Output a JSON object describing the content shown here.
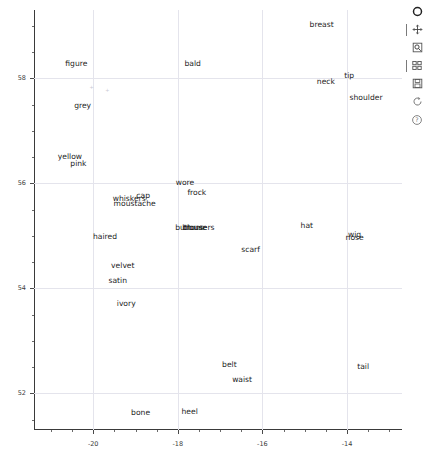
{
  "chart_data": {
    "type": "scatter",
    "title": "",
    "xlabel": "",
    "ylabel": "",
    "xlim": [
      -21.4,
      -12.7
    ],
    "ylim": [
      51.3,
      59.3
    ],
    "grid": true,
    "legend": null,
    "xticks": [
      -20,
      -18,
      -16,
      -14
    ],
    "xticklabels": [
      "-20",
      "-18",
      "-16",
      "-14"
    ],
    "yticks": [
      52,
      54,
      56,
      58
    ],
    "yticklabels": [
      "52",
      "54",
      "56",
      "58"
    ],
    "point_labels": [
      {
        "label": "breast",
        "x": -14.6,
        "y": 59.02
      },
      {
        "label": "figure",
        "x": -20.4,
        "y": 58.27
      },
      {
        "label": "bald",
        "x": -17.65,
        "y": 58.27
      },
      {
        "label": "tip",
        "x": -13.95,
        "y": 58.04
      },
      {
        "label": "neck",
        "x": -14.5,
        "y": 57.92
      },
      {
        "label": "shoulder",
        "x": -13.55,
        "y": 57.63
      },
      {
        "label": "grey",
        "x": -20.25,
        "y": 57.48
      },
      {
        "label": "yellow",
        "x": -20.55,
        "y": 56.5
      },
      {
        "label": "pink",
        "x": -20.35,
        "y": 56.37
      },
      {
        "label": "wore",
        "x": -17.83,
        "y": 56.0
      },
      {
        "label": "frock",
        "x": -17.55,
        "y": 55.82
      },
      {
        "label": "whiskers",
        "x": -19.15,
        "y": 55.7
      },
      {
        "label": "cap",
        "x": -18.82,
        "y": 55.75
      },
      {
        "label": "moustache",
        "x": -19.02,
        "y": 55.6
      },
      {
        "label": "hat",
        "x": -14.95,
        "y": 55.18
      },
      {
        "label": "buttons",
        "x": -17.72,
        "y": 55.15
      },
      {
        "label": "blouse",
        "x": -17.6,
        "y": 55.15
      },
      {
        "label": "trousers",
        "x": -17.5,
        "y": 55.15
      },
      {
        "label": "wig",
        "x": -13.82,
        "y": 55.02
      },
      {
        "label": "nose",
        "x": -13.82,
        "y": 54.95
      },
      {
        "label": "haired",
        "x": -19.72,
        "y": 54.98
      },
      {
        "label": "scarf",
        "x": -16.28,
        "y": 54.72
      },
      {
        "label": "velvet",
        "x": -19.3,
        "y": 54.42
      },
      {
        "label": "satin",
        "x": -19.42,
        "y": 54.13
      },
      {
        "label": "ivory",
        "x": -19.22,
        "y": 53.7
      },
      {
        "label": "belt",
        "x": -16.78,
        "y": 52.53
      },
      {
        "label": "tail",
        "x": -13.62,
        "y": 52.5
      },
      {
        "label": "waist",
        "x": -16.48,
        "y": 52.25
      },
      {
        "label": "bone",
        "x": -18.88,
        "y": 51.63
      },
      {
        "label": "heel",
        "x": -17.72,
        "y": 51.65
      }
    ],
    "faint_markers": [
      {
        "x": -20.05,
        "y": 57.83
      },
      {
        "x": -19.68,
        "y": 57.77
      }
    ]
  },
  "toolbar": {
    "buttons": [
      {
        "name": "home-icon",
        "tooltip": "Reset original view"
      },
      {
        "name": "move-icon",
        "tooltip": "Pan axes with left mouse"
      },
      {
        "name": "zoom-rect-icon",
        "tooltip": "Zoom to rectangle"
      },
      {
        "name": "configure-subplots-icon",
        "tooltip": "Configure subplots"
      },
      {
        "name": "save-icon",
        "tooltip": "Save the figure"
      },
      {
        "name": "refresh-icon",
        "tooltip": "Redraw"
      },
      {
        "name": "help-icon",
        "tooltip": "Help"
      }
    ]
  },
  "colors": {
    "background": "#ffffff",
    "grid": "#e4e4ec",
    "axis": "#3a3a3a",
    "label_text": "#1d1d1d",
    "tick_text": "#3c3c3c"
  }
}
